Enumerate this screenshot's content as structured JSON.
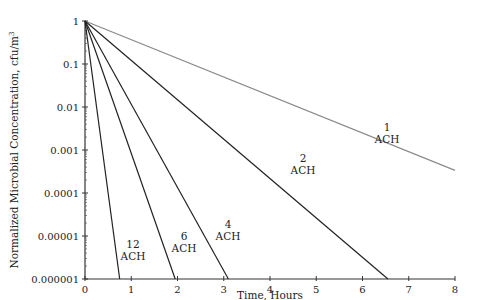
{
  "chart_data": {
    "type": "line",
    "title": "",
    "xlabel": "Time, Hours",
    "ylabel": "Normalized Microbial Concentration, cfu/m",
    "ylabel_superscript": "3",
    "yscale": "log",
    "xlim": [
      0,
      8
    ],
    "ylim": [
      1e-06,
      1
    ],
    "x_ticks": [
      "0",
      "1",
      "2",
      "3",
      "4",
      "5",
      "6",
      "7",
      "8"
    ],
    "y_ticks": [
      "1",
      "0.1",
      "0.01",
      "0.001",
      "0.0001",
      "0.00001",
      "0.000001"
    ],
    "grid": false,
    "legend": "inline labels",
    "series": [
      {
        "name": "1 ACH",
        "label_top": "1",
        "label_bottom": "ACH",
        "color": "#8a8a8a",
        "points": [
          [
            0,
            1
          ],
          [
            8,
            0.000335
          ]
        ]
      },
      {
        "name": "2 ACH",
        "label_top": "2",
        "label_bottom": "ACH",
        "color": "#222222",
        "points": [
          [
            0,
            1
          ],
          [
            6.55,
            1e-06
          ]
        ]
      },
      {
        "name": "4 ACH",
        "label_top": "4",
        "label_bottom": "ACH",
        "color": "#222222",
        "points": [
          [
            0,
            1
          ],
          [
            3.1,
            1e-06
          ]
        ]
      },
      {
        "name": "6 ACH",
        "label_top": "6",
        "label_bottom": "ACH",
        "color": "#222222",
        "points": [
          [
            0,
            1
          ],
          [
            1.95,
            1e-06
          ]
        ]
      },
      {
        "name": "12 ACH",
        "label_top": "12",
        "label_bottom": "ACH",
        "color": "#222222",
        "points": [
          [
            0,
            1
          ],
          [
            0.75,
            1e-06
          ]
        ]
      }
    ]
  }
}
